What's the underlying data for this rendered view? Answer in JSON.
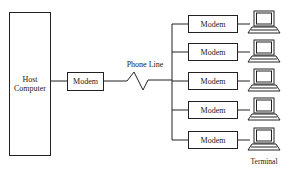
{
  "diagram": {
    "type": "network-topology",
    "host": {
      "label_line1": "Host",
      "label_line2": "Computer"
    },
    "host_modem": {
      "label": "Modem"
    },
    "link": {
      "label": "Phone Line"
    },
    "remote_modems": [
      {
        "label": "Modem"
      },
      {
        "label": "Modem"
      },
      {
        "label": "Modem"
      },
      {
        "label": "Modem"
      },
      {
        "label": "Modem"
      }
    ],
    "terminals": [
      {
        "icon": "laptop-terminal-icon"
      },
      {
        "icon": "laptop-terminal-icon"
      },
      {
        "icon": "laptop-terminal-icon"
      },
      {
        "icon": "laptop-terminal-icon"
      },
      {
        "icon": "laptop-terminal-icon"
      }
    ],
    "terminal_caption": "Terminal",
    "colors": {
      "line": "#222222",
      "background": "#ffffff"
    }
  }
}
